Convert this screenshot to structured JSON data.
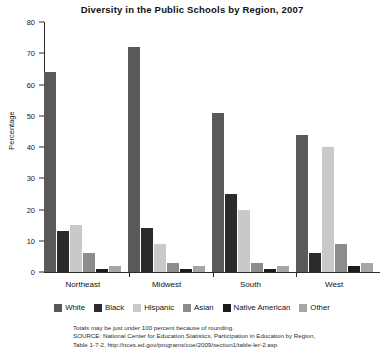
{
  "chart_data": {
    "type": "bar",
    "title": "Diversity in the Public Schools by Region, 2007",
    "xlabel": "",
    "ylabel": "Percentage",
    "ylim": [
      0,
      80
    ],
    "yticks": [
      0,
      10,
      20,
      30,
      40,
      50,
      60,
      70,
      80
    ],
    "grid": false,
    "legend_position": "bottom",
    "categories": [
      "Northeast",
      "Midwest",
      "South",
      "West"
    ],
    "series": [
      {
        "name": "White",
        "color": "#595959",
        "values": [
          64,
          72,
          51,
          44
        ]
      },
      {
        "name": "Black",
        "color": "#2b2b2b",
        "values": [
          13,
          14,
          25,
          6
        ]
      },
      {
        "name": "Hispanic",
        "color": "#c9c9c9",
        "values": [
          15,
          9,
          20,
          40
        ]
      },
      {
        "name": "Asian",
        "color": "#8c8c8c",
        "values": [
          6,
          3,
          3,
          9
        ]
      },
      {
        "name": "Native American",
        "color": "#1c1c1c",
        "values": [
          1,
          1,
          1,
          2
        ]
      },
      {
        "name": "Other",
        "color": "#a6a6a6",
        "values": [
          2,
          2,
          2,
          3
        ]
      }
    ]
  },
  "footnote": {
    "line1": "Totals may be just under 100 percent because of rounding.",
    "line2": "SOURCE: National Center for Education Statistics, Participation in Education by Region,",
    "line3": "Table 1-7-2, http://nces.ed.gov/programs/coe/2009/section1/table-ler-2.asp"
  }
}
